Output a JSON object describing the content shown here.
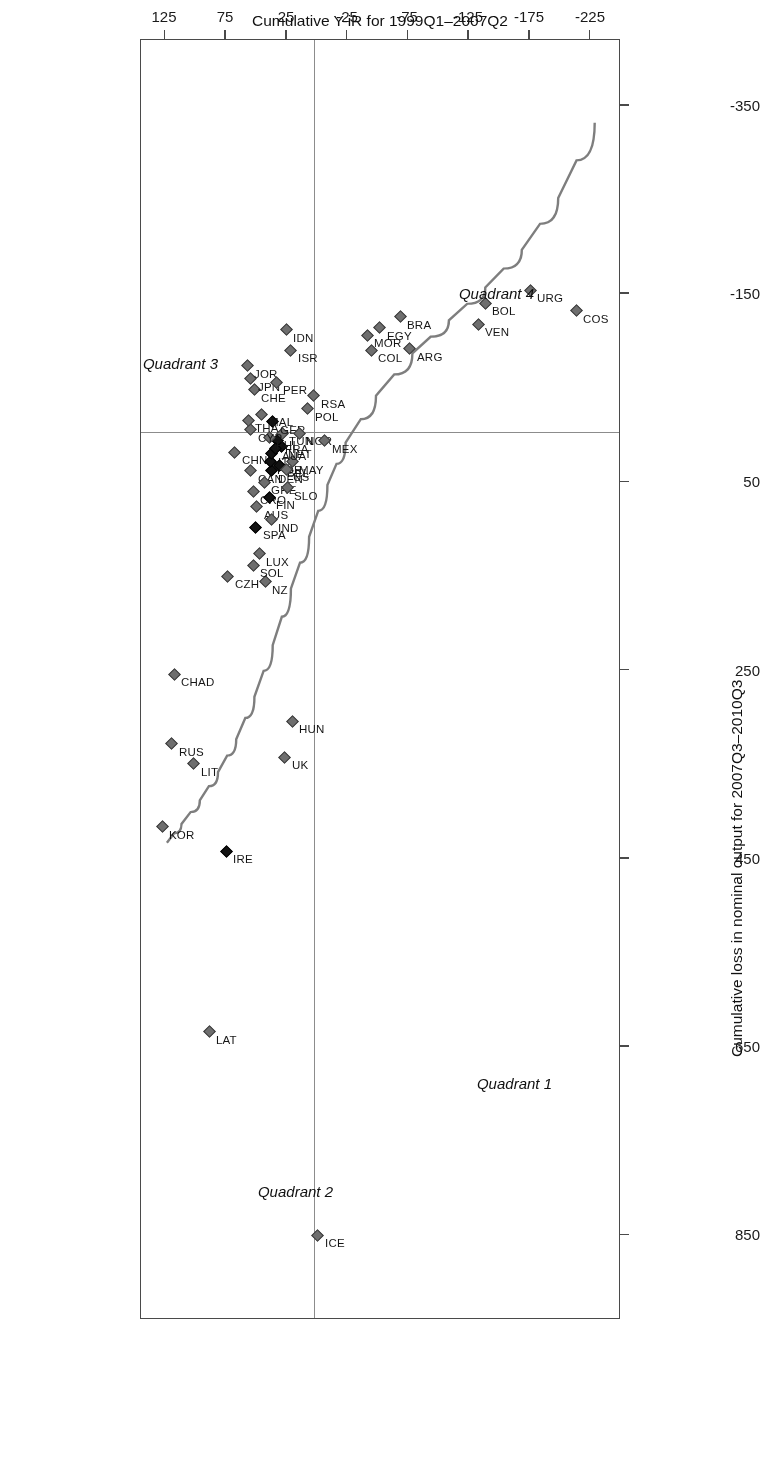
{
  "chart_data": {
    "type": "scatter",
    "title": "",
    "xlabel": "Cumulative Y-iR for 1999Q1–2007Q2",
    "ylabel": "Cumulative loss in nominal output for 2007Q3–2010Q3",
    "xlim": [
      -250,
      145
    ],
    "ylim": [
      -420,
      940
    ],
    "xticks": [
      "-225",
      "-175",
      "-125",
      "-75",
      "-25",
      "25",
      "75",
      "125"
    ],
    "xtick_values": [
      -225,
      -175,
      -125,
      -75,
      -25,
      25,
      75,
      125
    ],
    "yticks": [
      "850",
      "650",
      "450",
      "250",
      "50",
      "-150",
      "-350"
    ],
    "ytick_values": [
      850,
      650,
      450,
      250,
      50,
      -150,
      -350
    ],
    "grid": "reference lines at x=0 and y=0 dividing the plane into four quadrants",
    "legend": "none",
    "quadrant_labels": [
      {
        "name": "Quadrant 1",
        "x": -195,
        "y": 700
      },
      {
        "name": "Quadrant 2",
        "x": -15,
        "y": 815
      },
      {
        "name": "Quadrant 3",
        "x": 80,
        "y": -65
      },
      {
        "name": "Quadrant 4",
        "x": -180,
        "y": -140
      },
      {
        "name": "Quadrant 1 pos",
        "x": -195,
        "y": 700
      }
    ],
    "marker_note": "grey filled diamonds = all economies; black filled diamonds = euro-area / advanced subset",
    "fit_curve": {
      "description": "smoothed fitted trend line through the cloud, rising steeply from the lower left and flattening toward the upper right",
      "points": [
        {
          "x": -230,
          "y": -330
        },
        {
          "x": -200,
          "y": -250
        },
        {
          "x": -170,
          "y": -195
        },
        {
          "x": -140,
          "y": -155
        },
        {
          "x": -110,
          "y": -120
        },
        {
          "x": -80,
          "y": -85
        },
        {
          "x": -50,
          "y": -40
        },
        {
          "x": -25,
          "y": 10
        },
        {
          "x": -10,
          "y": 55
        },
        {
          "x": 5,
          "y": 110
        },
        {
          "x": 20,
          "y": 165
        },
        {
          "x": 35,
          "y": 225
        },
        {
          "x": 50,
          "y": 280
        },
        {
          "x": 65,
          "y": 325
        },
        {
          "x": 80,
          "y": 360
        },
        {
          "x": 95,
          "y": 390
        },
        {
          "x": 110,
          "y": 415
        },
        {
          "x": 122,
          "y": 435
        }
      ]
    },
    "points": [
      {
        "label": "ICE",
        "x": -2,
        "y": 852,
        "filled": false
      },
      {
        "label": "LAT",
        "x": 87,
        "y": 636,
        "filled": false
      },
      {
        "label": "IRE",
        "x": 73,
        "y": 444,
        "filled": true
      },
      {
        "label": "LIT",
        "x": 100,
        "y": 351,
        "filled": false
      },
      {
        "label": "RUS",
        "x": 118,
        "y": 330,
        "filled": false
      },
      {
        "label": "KOR",
        "x": 126,
        "y": 418,
        "filled": false
      },
      {
        "label": "CHAD",
        "x": 116,
        "y": 256,
        "filled": false
      },
      {
        "label": "UK",
        "x": 25,
        "y": 344,
        "filled": false
      },
      {
        "label": "HUN",
        "x": 19,
        "y": 306,
        "filled": false
      },
      {
        "label": "NZ",
        "x": 41,
        "y": 158,
        "filled": false
      },
      {
        "label": "LUX",
        "x": 46,
        "y": 128,
        "filled": false
      },
      {
        "label": "SOL",
        "x": 51,
        "y": 140,
        "filled": false
      },
      {
        "label": "CZH",
        "x": 72,
        "y": 152,
        "filled": false
      },
      {
        "label": "SPA",
        "x": 49,
        "y": 100,
        "filled": true
      },
      {
        "label": "AUS",
        "x": 48,
        "y": 78,
        "filled": false
      },
      {
        "label": "CRO",
        "x": 51,
        "y": 62,
        "filled": false
      },
      {
        "label": "CAN",
        "x": 53,
        "y": 40,
        "filled": false
      },
      {
        "label": "CHN",
        "x": 66,
        "y": 20,
        "filled": false
      },
      {
        "label": "IND",
        "x": 36,
        "y": 92,
        "filled": false
      },
      {
        "label": "FIN",
        "x": 38,
        "y": 68,
        "filled": true
      },
      {
        "label": "GRE",
        "x": 42,
        "y": 52,
        "filled": false
      },
      {
        "label": "DEN",
        "x": 36,
        "y": 40,
        "filled": true
      },
      {
        "label": "POR",
        "x": 37,
        "y": 30,
        "filled": true
      },
      {
        "label": "ITA",
        "x": 36,
        "y": 22,
        "filled": true
      },
      {
        "label": "BEL",
        "x": 29,
        "y": 34,
        "filled": true
      },
      {
        "label": "US",
        "x": 24,
        "y": 38,
        "filled": false
      },
      {
        "label": "SLO",
        "x": 23,
        "y": 58,
        "filled": false
      },
      {
        "label": "MAY",
        "x": 19,
        "y": 30,
        "filled": false
      },
      {
        "label": "NET",
        "x": 28,
        "y": 14,
        "filled": true
      },
      {
        "label": "FRA",
        "x": 31,
        "y": 8,
        "filled": true
      },
      {
        "label": "AUA",
        "x": 33,
        "y": 16,
        "filled": true
      },
      {
        "label": "TUN",
        "x": 27,
        "y": 0,
        "filled": false
      },
      {
        "label": "PHI",
        "x": 38,
        "y": 4,
        "filled": false
      },
      {
        "label": "GER",
        "x": 35,
        "y": -12,
        "filled": true
      },
      {
        "label": "MAL",
        "x": 44,
        "y": -20,
        "filled": false
      },
      {
        "label": "CYP",
        "x": 53,
        "y": -4,
        "filled": false
      },
      {
        "label": "THA",
        "x": 55,
        "y": -14,
        "filled": false
      },
      {
        "label": "CHE",
        "x": 50,
        "y": -46,
        "filled": false
      },
      {
        "label": "JPN",
        "x": 53,
        "y": -58,
        "filled": false
      },
      {
        "label": "JOR",
        "x": 56,
        "y": -72,
        "filled": false
      },
      {
        "label": "PER",
        "x": 32,
        "y": -54,
        "filled": false
      },
      {
        "label": "NOR",
        "x": 13,
        "y": 0,
        "filled": false
      },
      {
        "label": "POL",
        "x": 6,
        "y": -26,
        "filled": false
      },
      {
        "label": "MEX",
        "x": -8,
        "y": 8,
        "filled": false
      },
      {
        "label": "RSA",
        "x": 1,
        "y": -40,
        "filled": false
      },
      {
        "label": "ISR",
        "x": 20,
        "y": -88,
        "filled": false
      },
      {
        "label": "IDN",
        "x": 24,
        "y": -110,
        "filled": false
      },
      {
        "label": "COL",
        "x": -46,
        "y": -88,
        "filled": false
      },
      {
        "label": "MOR",
        "x": -43,
        "y": -104,
        "filled": false
      },
      {
        "label": "EGY",
        "x": -53,
        "y": -112,
        "filled": false
      },
      {
        "label": "BRA",
        "x": -70,
        "y": -124,
        "filled": false
      },
      {
        "label": "ARG",
        "x": -78,
        "y": -90,
        "filled": false
      },
      {
        "label": "VEN",
        "x": -134,
        "y": -116,
        "filled": false
      },
      {
        "label": "BOL",
        "x": -140,
        "y": -138,
        "filled": false
      },
      {
        "label": "URG",
        "x": -177,
        "y": -152,
        "filled": false
      },
      {
        "label": "COS",
        "x": -215,
        "y": -130,
        "filled": false
      }
    ]
  }
}
